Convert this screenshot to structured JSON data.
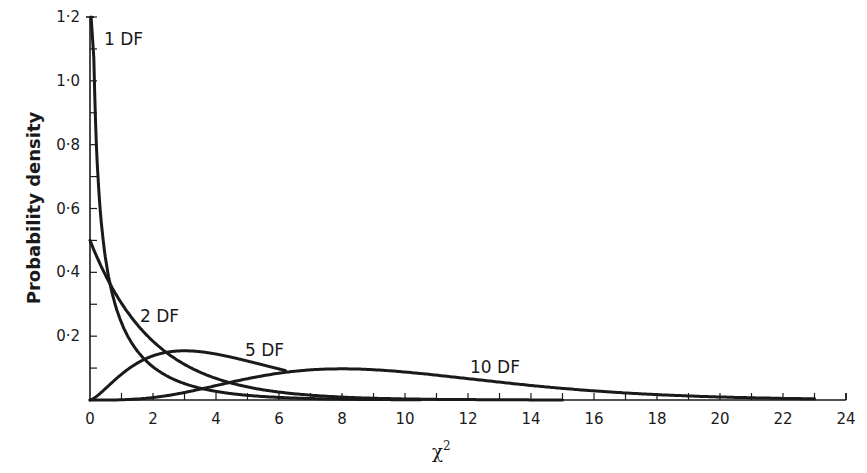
{
  "chart_data": {
    "type": "line",
    "title": "",
    "xlabel": "χ²",
    "ylabel": "Probability density",
    "xlim": [
      0,
      24
    ],
    "ylim": [
      0,
      1.2
    ],
    "grid": false,
    "legend": "inline labels",
    "x_ticks": [
      "0",
      "2",
      "4",
      "6",
      "8",
      "10",
      "12",
      "14",
      "16",
      "18",
      "20",
      "22",
      "24"
    ],
    "y_ticks": [
      "0",
      "0·2",
      "0·4",
      "0·6",
      "0·8",
      "1·0",
      "1·2"
    ],
    "series": [
      {
        "name": "1 DF",
        "df": 1,
        "x_end": 10.5,
        "x": [
          0.01,
          0.05,
          0.1,
          0.25,
          0.5,
          1,
          2,
          3,
          4,
          6,
          8,
          10.5
        ],
        "values": [
          3.97,
          1.73,
          1.2,
          0.7,
          0.44,
          0.24,
          0.1,
          0.05,
          0.027,
          0.008,
          0.003,
          0.001
        ]
      },
      {
        "name": "2 DF",
        "df": 2,
        "x_end": 15,
        "x": [
          0,
          1,
          2,
          3,
          4,
          6,
          8,
          10,
          12,
          15
        ],
        "values": [
          0.5,
          0.3,
          0.18,
          0.11,
          0.07,
          0.025,
          0.009,
          0.003,
          0.001,
          0.0003
        ]
      },
      {
        "name": "5 DF",
        "df": 5,
        "x_end": 6.2,
        "x": [
          0,
          1,
          2,
          3,
          4,
          5,
          6.2
        ],
        "values": [
          0,
          0.08,
          0.14,
          0.154,
          0.144,
          0.122,
          0.093
        ]
      },
      {
        "name": "10 DF",
        "df": 10,
        "x_end": 23,
        "x": [
          0,
          2,
          4,
          6,
          8,
          10,
          12,
          14,
          16,
          18,
          20,
          23
        ],
        "values": [
          0,
          0.008,
          0.045,
          0.08,
          0.095,
          0.088,
          0.068,
          0.047,
          0.029,
          0.017,
          0.009,
          0.003
        ]
      }
    ],
    "annotations": [
      {
        "text": "1 DF",
        "x": 0.9,
        "y": 1.12
      },
      {
        "text": "2 DF",
        "x": 1.8,
        "y": 0.25
      },
      {
        "text": "5 DF",
        "x": 4.9,
        "y": 0.14
      },
      {
        "text": "10 DF",
        "x": 11.9,
        "y": 0.085
      }
    ]
  },
  "labels": {
    "ylabel": "Probability density",
    "xlabel_base": "χ",
    "xlabel_sup": "2",
    "s1": "1 DF",
    "s2": "2 DF",
    "s5": "5 DF",
    "s10": "10 DF"
  }
}
